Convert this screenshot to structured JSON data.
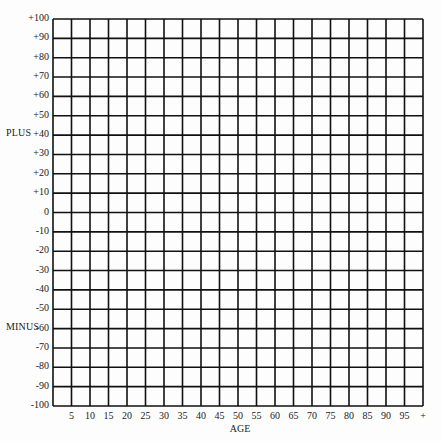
{
  "chart_data": {
    "type": "table",
    "title": "",
    "xlabel": "AGE",
    "ylabel_top": "PLUS",
    "ylabel_bottom": "MINUS",
    "x_tick_labels": [
      "5",
      "10",
      "15",
      "20",
      "25",
      "30",
      "35",
      "40",
      "45",
      "50",
      "55",
      "60",
      "65",
      "70",
      "75",
      "80",
      "85",
      "90",
      "95",
      "+"
    ],
    "y_tick_labels": [
      "+100",
      "+90",
      "+80",
      "+70",
      "+60",
      "+50",
      "+40",
      "+30",
      "+20",
      "+10",
      "0",
      "-10",
      "-20",
      "-30",
      "-40",
      "-50",
      "-60",
      "-70",
      "-80",
      "-90",
      "-100"
    ],
    "ylim": [
      -100,
      100
    ],
    "xlim": [
      0,
      100
    ],
    "grid": true,
    "columns": 20,
    "rows": 20,
    "series": [],
    "note": "Blank grid worksheet; no data plotted"
  },
  "layout": {
    "grid_left": 53,
    "grid_top": 19,
    "grid_right": 423,
    "grid_bottom": 406,
    "line_color": "#111111"
  }
}
